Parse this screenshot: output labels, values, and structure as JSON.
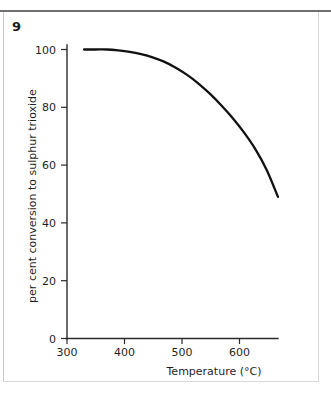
{
  "figure": {
    "number": "9"
  },
  "chart_data": {
    "type": "line",
    "title": "",
    "xlabel": "Temperature (°C)",
    "ylabel": "per cent conversion to sulphur trioxide",
    "xlim": [
      300,
      670
    ],
    "ylim": [
      0,
      100
    ],
    "grid": false,
    "legend": null,
    "xticks": [
      300,
      400,
      500,
      600
    ],
    "xticklabels": [
      "300",
      "400",
      "500",
      "600"
    ],
    "yticks": [
      0,
      20,
      40,
      60,
      80,
      100
    ],
    "yticklabels": [
      "0",
      "20",
      "40",
      "60",
      "80",
      "100"
    ],
    "series": [
      {
        "name": "conversion to sulphur trioxide",
        "x": [
          330,
          350,
          370,
          390,
          410,
          430,
          450,
          470,
          490,
          510,
          530,
          550,
          570,
          590,
          610,
          630,
          650,
          670
        ],
        "values": [
          100,
          100,
          100,
          99.7,
          99.2,
          98.4,
          97.3,
          95.8,
          93.8,
          91.3,
          88.3,
          84.8,
          80.8,
          76.4,
          71.4,
          65.6,
          58.4,
          49.0
        ]
      }
    ],
    "annotations": []
  }
}
